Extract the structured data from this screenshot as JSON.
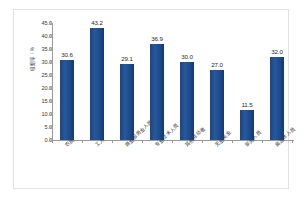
{
  "chart_data": {
    "type": "bar",
    "title": "",
    "subtitle": "",
    "xlabel": "",
    "ylabel": "吸烟率 / %",
    "categories": [
      "农民",
      "工人",
      "商业服务业人员",
      "专业技术人员",
      "其他劳动者",
      "无业失业",
      "家务人员",
      "离退休人员"
    ],
    "values": [
      30.6,
      43.2,
      29.1,
      36.9,
      30.0,
      27.0,
      11.5,
      32.0
    ],
    "value_labels": [
      "30.6",
      "43.2",
      "29.1",
      "36.9",
      "30.0",
      "27.0",
      "11.5",
      "32.0"
    ],
    "ylim": [
      0.0,
      45.0
    ],
    "ytick_labels": [
      "45.0",
      "40.0",
      "35.0",
      "30.0",
      "25.0",
      "20.0",
      "15.0",
      "10.0",
      "5.0",
      "0.0"
    ],
    "ytick_values": [
      45.0,
      40.0,
      35.0,
      30.0,
      25.0,
      20.0,
      15.0,
      10.0,
      5.0,
      0.0
    ],
    "grid": false,
    "legend": false,
    "legend_position": "none",
    "series": [
      {
        "name": "吸烟率",
        "values": [
          30.6,
          43.2,
          29.1,
          36.9,
          30.0,
          27.0,
          11.5,
          32.0
        ]
      }
    ]
  },
  "colors": {
    "bar": "#1f4e8c",
    "axis": "#9a9a9a",
    "text": "#3c3c3c",
    "frame": "#e2e2e4",
    "background": "#ffffff"
  }
}
